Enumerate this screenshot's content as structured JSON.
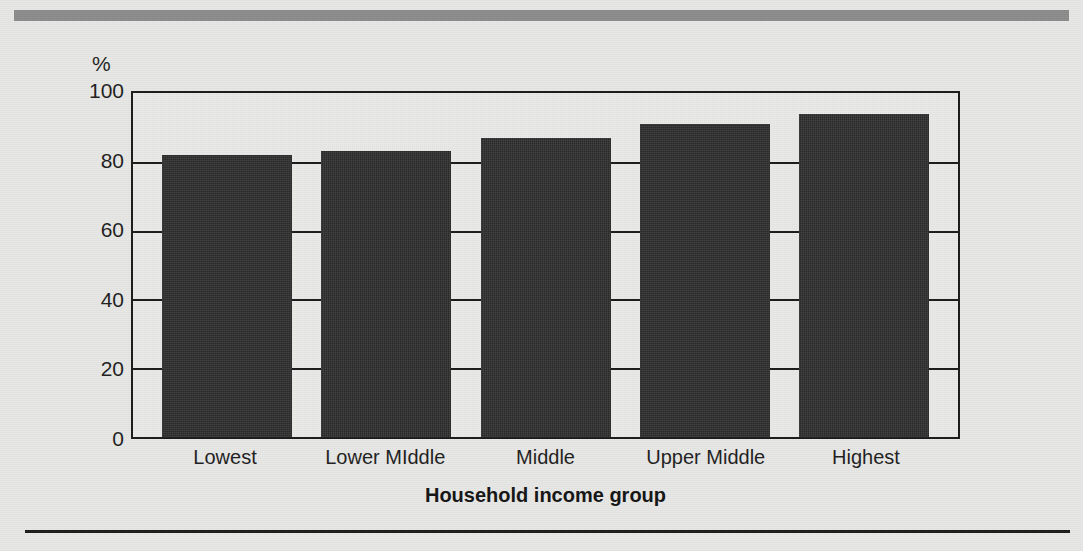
{
  "figure": {
    "top_band": "decorative-gray-band",
    "bottom_rule": "horizontal-rule"
  },
  "chart_data": {
    "type": "bar",
    "title": "",
    "subtitle": "",
    "xlabel": "Household income group",
    "ylabel": "%",
    "categories": [
      "Lowest",
      "Lower MIddle",
      "Middle",
      "Upper Middle",
      "Highest"
    ],
    "values": [
      82,
      83,
      87,
      91,
      94
    ],
    "ylim": [
      0,
      100
    ],
    "yticks": [
      0,
      20,
      40,
      60,
      80,
      100
    ],
    "ytick_labels": [
      "0",
      "20",
      "40",
      "60",
      "80",
      "100"
    ],
    "grid": true,
    "grid_axis": "y",
    "legend": false,
    "legend_position": "none",
    "bar_color": "#2e2e2e",
    "background_color": "#e8e8e6",
    "axis_color": "#1c1c1c"
  }
}
